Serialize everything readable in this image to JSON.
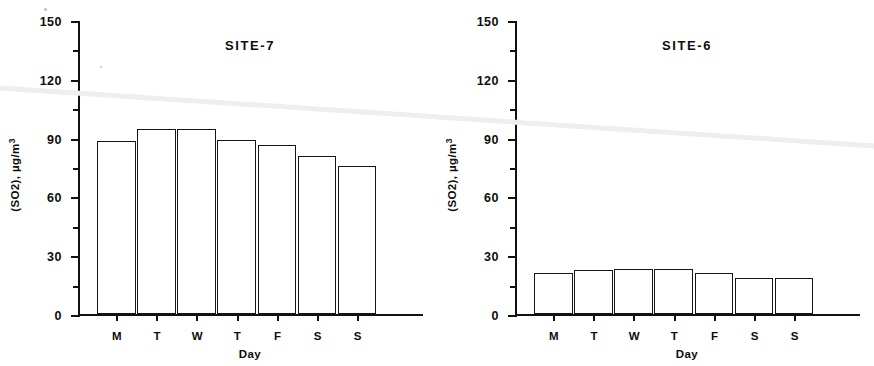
{
  "figure": {
    "width": 874,
    "height": 366,
    "background": "#ffffff",
    "ink_color": "#111111",
    "artifact_color": "#ececec"
  },
  "panels": [
    {
      "id": "site-7",
      "title": "SITE-7",
      "ylabel": "(SO2), µg/m",
      "ylabel_exponent": "3",
      "xlabel": "Day"
    },
    {
      "id": "site-6",
      "title": "SITE-6",
      "ylabel": "(SO2), µg/m",
      "ylabel_exponent": "3",
      "xlabel": "Day"
    }
  ],
  "axis": {
    "y_major_ticks": [
      "0",
      "30",
      "60",
      "90",
      "120",
      "150"
    ],
    "y_minor_ticks": [
      "15",
      "45",
      "75",
      "105",
      "135"
    ],
    "y_min": 0,
    "y_max": 150,
    "x_categories": [
      "M",
      "T",
      "W",
      "T",
      "F",
      "S",
      "S"
    ]
  },
  "chart_data": [
    {
      "type": "bar",
      "title": "SITE-7",
      "xlabel": "Day",
      "ylabel": "(SO2), µg/m3",
      "categories": [
        "M",
        "T",
        "W",
        "T",
        "F",
        "S",
        "S"
      ],
      "values": [
        89,
        95,
        95,
        89.5,
        87,
        81,
        76
      ],
      "ylim": [
        0,
        150
      ],
      "yticks": [
        0,
        30,
        60,
        90,
        120,
        150
      ],
      "grid": false,
      "legend": false
    },
    {
      "type": "bar",
      "title": "SITE-6",
      "xlabel": "Day",
      "ylabel": "(SO2), µg/m3",
      "categories": [
        "M",
        "T",
        "W",
        "T",
        "F",
        "S",
        "S"
      ],
      "values": [
        21,
        22.5,
        23,
        23,
        21,
        18.5,
        18.5
      ],
      "ylim": [
        0,
        150
      ],
      "yticks": [
        0,
        30,
        60,
        90,
        120,
        150
      ],
      "grid": false,
      "legend": false
    }
  ],
  "artifact": {
    "name": "scan-streak",
    "x1": 0,
    "y1": 88,
    "x2": 874,
    "y2": 146,
    "color": "#eeeeee",
    "thickness": 5
  }
}
